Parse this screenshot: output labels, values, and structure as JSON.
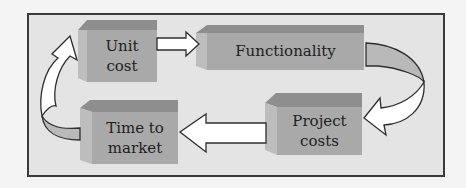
{
  "diagram": {
    "type": "cycle",
    "nodes": [
      {
        "id": "unit_cost",
        "label": "Unit\ncost"
      },
      {
        "id": "functionality",
        "label": "Functionality"
      },
      {
        "id": "project_costs",
        "label": "Project\ncosts"
      },
      {
        "id": "time_to_market",
        "label": "Time to\nmarket"
      }
    ],
    "edges": [
      {
        "from": "unit_cost",
        "to": "functionality",
        "style": "block-arrow-straight"
      },
      {
        "from": "functionality",
        "to": "project_costs",
        "style": "block-arrow-curved"
      },
      {
        "from": "project_costs",
        "to": "time_to_market",
        "style": "block-arrow-straight"
      },
      {
        "from": "time_to_market",
        "to": "unit_cost",
        "style": "block-arrow-curved"
      }
    ],
    "colors": {
      "box_front": "#a9a9a9",
      "box_top": "#8e8e8e",
      "box_side": "#bdbdbd",
      "arrow_fill": "#ffffff",
      "arrow_stroke": "#2e2e2e",
      "frame_bg": "#e4e4e4",
      "frame_border": "#3a3a3a"
    }
  }
}
